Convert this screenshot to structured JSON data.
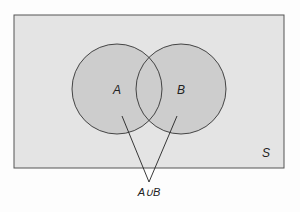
{
  "diagram": {
    "type": "venn",
    "universe": {
      "label": "S",
      "fill": "#e4e4e4",
      "stroke": "#555555"
    },
    "sets": [
      {
        "label": "A",
        "fill": "#cdcdcd",
        "stroke": "#333333"
      },
      {
        "label": "B",
        "fill": "#cdcdcd",
        "stroke": "#333333"
      }
    ],
    "annotation": {
      "label": "A∪B",
      "points_to": [
        "A",
        "B"
      ]
    }
  }
}
